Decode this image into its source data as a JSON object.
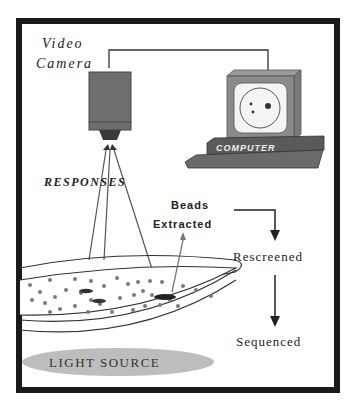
{
  "diagram": {
    "labels": {
      "camera_line1": "Video",
      "camera_line2": "Camera",
      "responses": "RESPONSES",
      "computer": "COMPUTER",
      "beads_line1": "Beads",
      "beads_line2": "Extracted",
      "rescreened": "Rescreened",
      "sequenced": "Sequenced",
      "light_source": "LIGHT SOURCE"
    },
    "components": [
      {
        "id": "video-camera",
        "label": "Video Camera"
      },
      {
        "id": "computer",
        "label": "COMPUTER"
      },
      {
        "id": "petri-dish",
        "label": "bead plate"
      },
      {
        "id": "light-source",
        "label": "LIGHT SOURCE"
      }
    ],
    "flow": [
      "Beads Extracted",
      "Rescreened",
      "Sequenced"
    ],
    "colors": {
      "frame": "#1a1a1a",
      "camera_body": "#6e6e6e",
      "computer_body": "#8a8a8a",
      "computer_base": "#5a5a5a",
      "light_source": "#bdbdbd",
      "bead": "#7a7a7a",
      "line": "#333333"
    }
  }
}
